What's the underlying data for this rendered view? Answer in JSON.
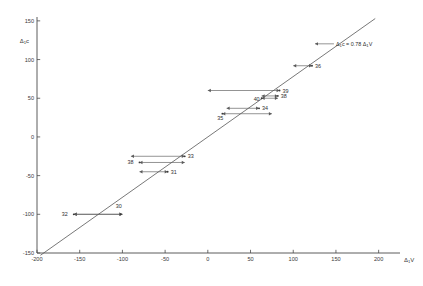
{
  "chart_data": {
    "type": "scatter",
    "title": "",
    "xlabel": "Δ₁V",
    "ylabel": "Δ₁c",
    "xlim": [
      -200,
      225
    ],
    "ylim": [
      -150,
      155
    ],
    "xticks": [
      -200,
      -150,
      -100,
      -50,
      0,
      50,
      100,
      150,
      200
    ],
    "xticklabels": [
      "-200",
      "-150",
      "-100",
      "-50",
      "0",
      "50",
      "100",
      "150",
      "200"
    ],
    "yticks": [
      -150,
      -100,
      -50,
      0,
      50,
      100,
      150
    ],
    "yticklabels": [
      "-150",
      "-100",
      "-50",
      "0",
      "50",
      "100",
      "150"
    ],
    "grid": false,
    "legend": "none",
    "annotation": {
      "text": "Δ₁c = 0.78 Δ₁V",
      "x": 150,
      "y": 118,
      "arrow_to_x": 122,
      "arrow_to_y": 118
    },
    "fit": {
      "label": "Δ₁c = 0.78 Δ₁V",
      "slope": 0.78,
      "intercept": 0,
      "x_start": -196,
      "x_end": 196,
      "y_start": -153,
      "y_end": 153
    },
    "points": [
      {
        "label": "30",
        "x": -102,
        "y": -100,
        "err_low": -157,
        "err_high": -100,
        "label_dx": -2,
        "label_dy": -6,
        "label_anchor": "middle"
      },
      {
        "label": "32",
        "x": -157,
        "y": -100,
        "err_low": -157,
        "err_high": -100,
        "label_dx": -6,
        "label_dy": 2,
        "label_anchor": "end"
      },
      {
        "label": "31",
        "x": -47,
        "y": -45,
        "err_low": -80,
        "err_high": -47,
        "label_dx": 3,
        "label_dy": 2,
        "label_anchor": "start"
      },
      {
        "label": "38",
        "x": -80,
        "y": -33,
        "err_low": -80,
        "err_high": -27,
        "label_dx": -6,
        "label_dy": 2,
        "label_anchor": "end"
      },
      {
        "label": "33",
        "x": -27,
        "y": -25,
        "err_low": -90,
        "err_high": -27,
        "label_dx": 3,
        "label_dy": 2,
        "label_anchor": "start"
      },
      {
        "label": "35",
        "x": 17,
        "y": 30,
        "err_low": 17,
        "err_high": 75,
        "label_dx": -2,
        "label_dy": 6,
        "label_anchor": "middle"
      },
      {
        "label": "34",
        "x": 60,
        "y": 37,
        "err_low": 22,
        "err_high": 60,
        "label_dx": 3,
        "label_dy": 2,
        "label_anchor": "start"
      },
      {
        "label": "40",
        "x": 63,
        "y": 50,
        "err_low": 63,
        "err_high": 82,
        "label_dx": -2,
        "label_dy": 3,
        "label_anchor": "end"
      },
      {
        "label": "38",
        "x": 82,
        "y": 53,
        "err_low": 63,
        "err_high": 82,
        "label_dx": 3,
        "label_dy": 2,
        "label_anchor": "start"
      },
      {
        "label": "39",
        "x": 84,
        "y": 60,
        "err_low": 0,
        "err_high": 84,
        "label_dx": 3,
        "label_dy": 2,
        "label_anchor": "start"
      },
      {
        "label": "36",
        "x": 122,
        "y": 92,
        "err_low": 100,
        "err_high": 122,
        "label_dx": 3,
        "label_dy": 2,
        "label_anchor": "start"
      }
    ]
  }
}
